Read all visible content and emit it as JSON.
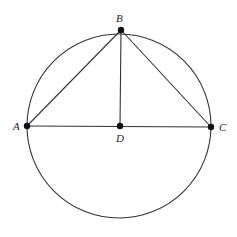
{
  "diagram": {
    "type": "geometry",
    "colors": {
      "stroke": "#333333",
      "point": "#111111",
      "label": "#222222",
      "background": "#ffffff"
    },
    "circle": {
      "cx": 119,
      "cy": 126,
      "r": 92
    },
    "points": {
      "A": {
        "label": "A",
        "x": 27,
        "y": 126,
        "label_x": 13,
        "label_y": 130
      },
      "B": {
        "label": "B",
        "x": 121,
        "y": 30,
        "label_x": 116,
        "label_y": 22
      },
      "C": {
        "label": "C",
        "x": 211,
        "y": 127,
        "label_x": 219,
        "label_y": 131
      },
      "D": {
        "label": "D",
        "x": 120,
        "y": 126,
        "label_x": 116,
        "label_y": 142
      }
    },
    "segments": [
      {
        "name": "AB",
        "from": "A",
        "to": "B"
      },
      {
        "name": "BC",
        "from": "B",
        "to": "C"
      },
      {
        "name": "AC",
        "from": "A",
        "to": "C"
      },
      {
        "name": "BD",
        "from": "B",
        "to": "D"
      }
    ]
  }
}
